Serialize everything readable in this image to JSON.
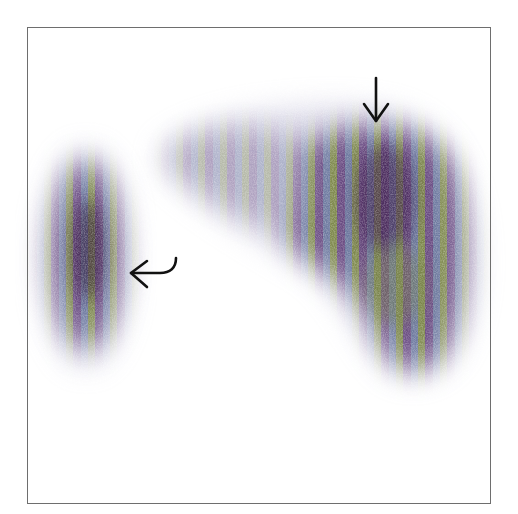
{
  "figure": {
    "frame_color": "#6e6e6e",
    "background_color": "#ffffff",
    "palette": {
      "dark_purple": "#3b1f4a",
      "purple": "#6b4d84",
      "blue_gray": "#7a82a8",
      "olive_green": "#7f8a4e",
      "halo": "#b9b6d2"
    },
    "regions": [
      {
        "id": "left-organ",
        "label": "spleen-like uptake",
        "cx": 88,
        "cy": 255,
        "rx": 42,
        "ry": 100
      },
      {
        "id": "right-organ",
        "label": "liver-like uptake",
        "cx": 370,
        "cy": 230,
        "rx": 100,
        "ry": 140
      }
    ],
    "annotations": [
      {
        "id": "straight-arrow",
        "type": "straight-arrow",
        "direction": "down",
        "tip": [
          376,
          122
        ],
        "tail": [
          376,
          78
        ]
      },
      {
        "id": "curved-arrow",
        "type": "curved-arrow",
        "direction": "left",
        "tip": [
          130,
          273
        ],
        "tail": [
          176,
          258
        ]
      }
    ]
  }
}
